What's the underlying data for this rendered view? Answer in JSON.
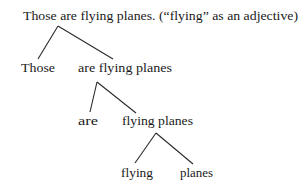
{
  "diagram": {
    "type": "parse-tree",
    "title": "Those are flying planes. (“flying” as an adjective)",
    "nodes": {
      "root": "Those are flying planes. (“flying” as an adjective)",
      "n1_left": "Those",
      "n1_right": "are flying planes",
      "n2_left": "are",
      "n2_right": "flying planes",
      "n3_left": "flying",
      "n3_right": "planes"
    },
    "edges": [
      {
        "from": "root",
        "to": "n1_left"
      },
      {
        "from": "root",
        "to": "n1_right"
      },
      {
        "from": "n1_right",
        "to": "n2_left"
      },
      {
        "from": "n1_right",
        "to": "n2_right"
      },
      {
        "from": "n2_right",
        "to": "n3_left"
      },
      {
        "from": "n2_right",
        "to": "n3_right"
      }
    ],
    "colors": {
      "text": "#1a1a1a",
      "line": "#2a2a2a",
      "background": "#ffffff"
    }
  }
}
